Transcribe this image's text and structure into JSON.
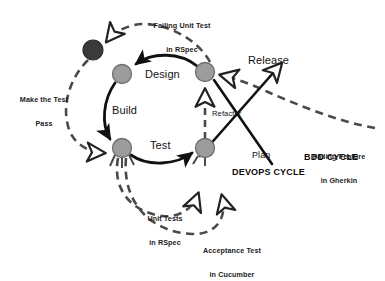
{
  "diagram": {
    "colors": {
      "node_light_fill": "#9c9c9c",
      "node_light_stroke": "#6e6e6e",
      "node_dark_fill": "#3a3a3a",
      "node_dark_stroke": "#2b2b2b",
      "solid_line": "#111111",
      "dashed_line": "#4a4a4a",
      "text": "#131313",
      "background": "#ffffff"
    },
    "nodes": [
      {
        "id": "start",
        "name": "start-node",
        "shade": "dark",
        "cx": 93,
        "cy": 50,
        "r": 10
      },
      {
        "id": "design",
        "name": "design-node",
        "shade": "light",
        "cx": 122,
        "cy": 74,
        "r": 9.5
      },
      {
        "id": "plan",
        "name": "plan-node",
        "shade": "light",
        "cx": 205,
        "cy": 72,
        "r": 9.5
      },
      {
        "id": "build",
        "name": "build-node",
        "shade": "light",
        "cx": 122,
        "cy": 148,
        "r": 9.5
      },
      {
        "id": "test",
        "name": "test-node",
        "shade": "light",
        "cx": 205,
        "cy": 148,
        "r": 9.5
      }
    ],
    "inner_cycle_labels": [
      {
        "id": "design",
        "text": "Design",
        "x": 145,
        "y": 68
      },
      {
        "id": "build",
        "text": "Build",
        "x": 112,
        "y": 104
      },
      {
        "id": "test",
        "text": "Test",
        "x": 150,
        "y": 139
      }
    ],
    "outer_labels": [
      {
        "id": "release",
        "text": "Release",
        "x": 248,
        "y": 54
      },
      {
        "id": "plan",
        "text": "Plan",
        "x": 252,
        "y": 150
      }
    ],
    "annotations": [
      {
        "id": "failing-unit-test",
        "line1": "Failing Unit Test",
        "line2": "in RSpec",
        "x": 136,
        "y": 6,
        "width": 92
      },
      {
        "id": "make-the-test-pass",
        "line1": "Make the Test",
        "line2": "Pass",
        "x": 8,
        "y": 80,
        "width": 72
      },
      {
        "id": "unit-tests-rspec",
        "line1": "Unit Tests",
        "line2": "in RSpec",
        "x": 134,
        "y": 199,
        "width": 62
      },
      {
        "id": "acceptance-test-cucumber",
        "line1": "Acceptance Test",
        "line2": "in Cucumber",
        "x": 186,
        "y": 231,
        "width": 92
      },
      {
        "id": "failing-feature-gherkin",
        "line1": "Failing Feature",
        "line2": "in Gherkin",
        "x": 298,
        "y": 137,
        "width": 82
      }
    ],
    "refactor_label": {
      "text": "Refactor",
      "x": 212,
      "y": 110
    },
    "cycle_labels": [
      {
        "id": "bdd-cycle",
        "text": "BDD CYCLE",
        "x": 304,
        "y": 152
      },
      {
        "id": "devops-cycle",
        "text": "DEVOPS CYCLE",
        "x": 232,
        "y": 167
      }
    ]
  }
}
